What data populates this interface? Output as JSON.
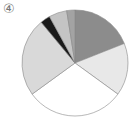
{
  "label": "④",
  "chart_data": {
    "type": "pie",
    "title": "",
    "start": "12 o'clock",
    "direction": "clockwise",
    "legend": "none",
    "slices": [
      {
        "name": "slice-1",
        "value": 19,
        "color": "#8c8c8c"
      },
      {
        "name": "slice-2",
        "value": 16,
        "color": "#e8e8e8"
      },
      {
        "name": "slice-3",
        "value": 30,
        "color": "#ffffff"
      },
      {
        "name": "slice-4",
        "value": 24,
        "color": "#d9d9d9"
      },
      {
        "name": "slice-5",
        "value": 3,
        "color": "#1a1a1a"
      },
      {
        "name": "slice-6",
        "value": 5.5,
        "color": "#c4c4c4"
      },
      {
        "name": "slice-7",
        "value": 2.5,
        "color": "#a3a3a3"
      }
    ],
    "outline_color": "#888888"
  }
}
